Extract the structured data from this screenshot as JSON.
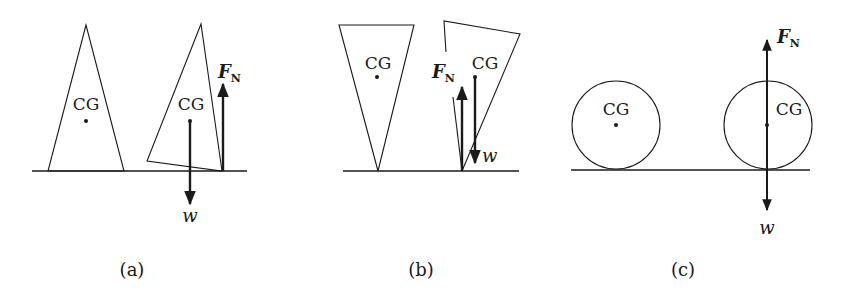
{
  "panels": [
    {
      "caption": "(a)",
      "shape": "triangle-upright",
      "left_object": {
        "label": "CG"
      },
      "right_object": {
        "label": "CG",
        "state": "tilted"
      },
      "forces": {
        "normal": {
          "symbol": "F",
          "subscript": "N"
        },
        "weight": {
          "symbol": "w"
        }
      }
    },
    {
      "caption": "(b)",
      "shape": "triangle-inverted",
      "left_object": {
        "label": "CG"
      },
      "right_object": {
        "label": "CG",
        "state": "tilted"
      },
      "forces": {
        "normal": {
          "symbol": "F",
          "subscript": "N"
        },
        "weight": {
          "symbol": "w"
        }
      }
    },
    {
      "caption": "(c)",
      "shape": "circle",
      "left_object": {
        "label": "CG"
      },
      "right_object": {
        "label": "CG",
        "state": "rolled"
      },
      "forces": {
        "normal": {
          "symbol": "F",
          "subscript": "N"
        },
        "weight": {
          "symbol": "w"
        }
      }
    }
  ]
}
